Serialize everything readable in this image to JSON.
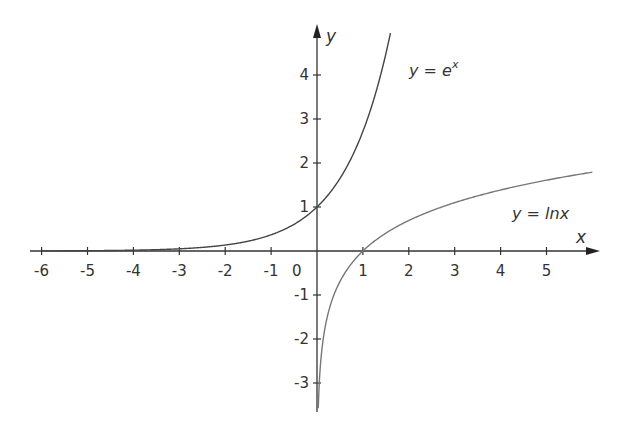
{
  "chart_data": {
    "type": "line",
    "title": "",
    "xlabel": "x",
    "ylabel": "y",
    "xlim": [
      -6.2,
      6.2
    ],
    "ylim": [
      -3.6,
      5.0
    ],
    "grid": false,
    "x_ticks": [
      -6,
      -5,
      -4,
      -3,
      -2,
      -1,
      1,
      2,
      3,
      4,
      5
    ],
    "x_tick_labels": [
      "-6",
      "-5",
      "-4",
      "-3",
      "-2",
      "-1",
      "1",
      "2",
      "3",
      "4",
      "5"
    ],
    "y_ticks": [
      -3,
      -2,
      -1,
      1,
      2,
      3,
      4
    ],
    "y_tick_labels": [
      "-3",
      "-2",
      "-1",
      "1",
      "2",
      "3",
      "4"
    ],
    "origin_label": "0",
    "series": [
      {
        "name": "y = e^x",
        "label_prefix": "y = e",
        "label_sup": "x",
        "function": "exp",
        "domain": [
          -6,
          1.6
        ],
        "color": "#444444",
        "points": [
          [
            -6,
            0.0025
          ],
          [
            -5,
            0.0067
          ],
          [
            -4,
            0.018
          ],
          [
            -3,
            0.05
          ],
          [
            -2,
            0.135
          ],
          [
            -1,
            0.368
          ],
          [
            0,
            1
          ],
          [
            0.5,
            1.649
          ],
          [
            1,
            2.718
          ],
          [
            1.5,
            4.482
          ],
          [
            1.6,
            4.953
          ]
        ]
      },
      {
        "name": "y = lnx",
        "label_prefix": "y = ",
        "label_fn": "lnx",
        "function": "ln",
        "domain": [
          0.028,
          6.0
        ],
        "color": "#777777",
        "points": [
          [
            0.028,
            -3.58
          ],
          [
            0.05,
            -3.0
          ],
          [
            0.1,
            -2.303
          ],
          [
            0.25,
            -1.386
          ],
          [
            0.5,
            -0.693
          ],
          [
            1,
            0
          ],
          [
            2,
            0.693
          ],
          [
            3,
            1.099
          ],
          [
            4,
            1.386
          ],
          [
            5,
            1.609
          ],
          [
            6,
            1.792
          ]
        ]
      }
    ]
  }
}
